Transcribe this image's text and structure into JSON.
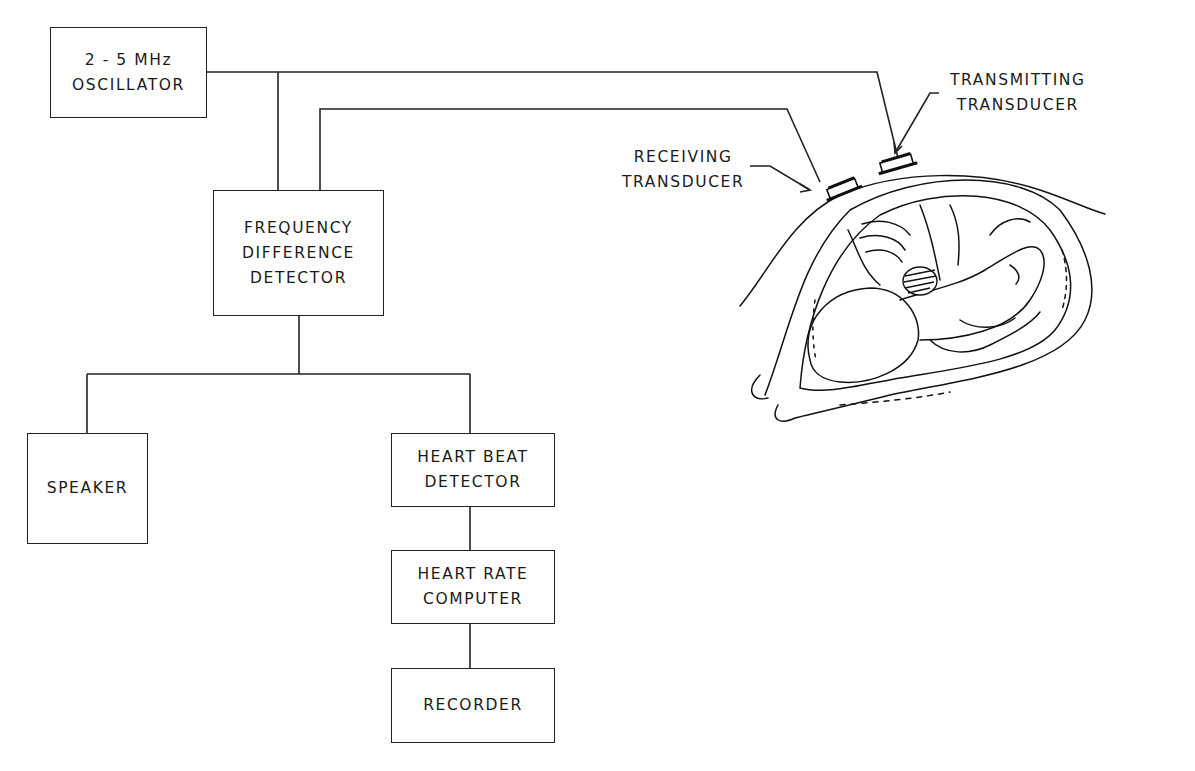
{
  "diagram": {
    "type": "block diagram",
    "blocks": [
      {
        "id": "oscillator",
        "lines": [
          "2 - 5 MHz",
          "OSCILLATOR"
        ]
      },
      {
        "id": "frequency_difference_detector",
        "lines": [
          "FREQUENCY",
          "DIFFERENCE",
          "DETECTOR"
        ]
      },
      {
        "id": "speaker",
        "lines": [
          "SPEAKER"
        ]
      },
      {
        "id": "heart_beat_detector",
        "lines": [
          "HEART BEAT",
          "DETECTOR"
        ]
      },
      {
        "id": "heart_rate_computer",
        "lines": [
          "HEART RATE",
          "COMPUTER"
        ]
      },
      {
        "id": "recorder",
        "lines": [
          "RECORDER"
        ]
      }
    ],
    "labels": {
      "receiving": [
        "RECEIVING",
        "TRANSDUCER"
      ],
      "transmitting": [
        "TRANSMITTING",
        "TRANSDUCER"
      ]
    },
    "connections": [
      {
        "from": "oscillator",
        "to": "transmitting_transducer"
      },
      {
        "from": "oscillator",
        "to": "frequency_difference_detector"
      },
      {
        "from": "receiving_transducer",
        "to": "frequency_difference_detector"
      },
      {
        "from": "frequency_difference_detector",
        "to": "speaker"
      },
      {
        "from": "frequency_difference_detector",
        "to": "heart_beat_detector"
      },
      {
        "from": "heart_beat_detector",
        "to": "heart_rate_computer"
      },
      {
        "from": "heart_rate_computer",
        "to": "recorder"
      }
    ],
    "illustration": "cross-section of pregnant abdomen with fetus, two transducers on abdominal wall, shaded fetal heart",
    "line_color": "#222222",
    "background": "#ffffff"
  }
}
